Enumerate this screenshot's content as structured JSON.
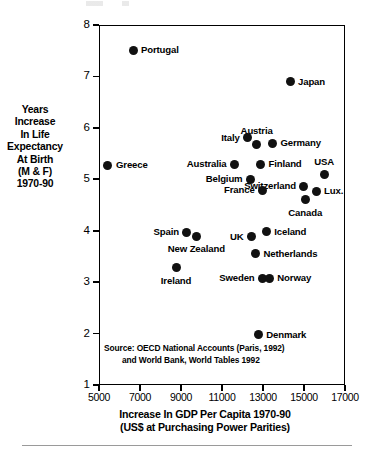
{
  "chart_data": {
    "type": "scatter",
    "title": "",
    "xlabel": "Increase In GDP Per Capita 1970-90",
    "xlabel_line2": "(US$ at Purchasing Power Parities)",
    "ylabel_lines": [
      "Years",
      "Increase",
      "In Life",
      "Expectancy",
      "At Birth",
      "(M & F)",
      "1970-90"
    ],
    "xlim": [
      5000,
      17000
    ],
    "ylim": [
      1,
      8
    ],
    "xticks": [
      5000,
      7000,
      9000,
      11000,
      13000,
      15000,
      17000
    ],
    "xtick_labels": [
      "5000",
      "7000",
      "9000",
      "11000",
      "13000",
      "15000",
      "17000"
    ],
    "yticks": [
      1,
      2,
      3,
      4,
      5,
      6,
      7,
      8
    ],
    "ytick_labels": [
      "1",
      "2",
      "3",
      "4",
      "5",
      "6",
      "7",
      "8"
    ],
    "grid": false,
    "legend": "none",
    "marker_color": "#111111",
    "points": [
      {
        "label": "Portugal",
        "x": 6610,
        "y": 7.53,
        "label_pos": "right"
      },
      {
        "label": "Japan",
        "x": 14270,
        "y": 6.92,
        "label_pos": "right"
      },
      {
        "label": "Greece",
        "x": 5390,
        "y": 5.29,
        "label_pos": "right"
      },
      {
        "label": "Italy",
        "x": 12200,
        "y": 5.83,
        "label_pos": "left"
      },
      {
        "label": "Austria",
        "x": 12640,
        "y": 5.7,
        "label_pos": "above"
      },
      {
        "label": "Germany",
        "x": 13410,
        "y": 5.72,
        "label_pos": "right"
      },
      {
        "label": "Australia",
        "x": 11560,
        "y": 5.31,
        "label_pos": "left"
      },
      {
        "label": "Finland",
        "x": 12830,
        "y": 5.31,
        "label_pos": "right"
      },
      {
        "label": "USA",
        "x": 15930,
        "y": 5.11,
        "label_pos": "above"
      },
      {
        "label": "Belgium",
        "x": 12340,
        "y": 5.02,
        "label_pos": "left"
      },
      {
        "label": "Switzerland",
        "x": 14950,
        "y": 4.88,
        "label_pos": "left"
      },
      {
        "label": "Lux.",
        "x": 15540,
        "y": 4.79,
        "label_pos": "right"
      },
      {
        "label": "France",
        "x": 12930,
        "y": 4.81,
        "label_pos": "left"
      },
      {
        "label": "Canada",
        "x": 15010,
        "y": 4.62,
        "label_pos": "below"
      },
      {
        "label": "Spain",
        "x": 9240,
        "y": 3.99,
        "label_pos": "left"
      },
      {
        "label": "New Zealand",
        "x": 9700,
        "y": 3.91,
        "label_pos": "below"
      },
      {
        "label": "UK",
        "x": 12390,
        "y": 3.9,
        "label_pos": "left"
      },
      {
        "label": "Iceland",
        "x": 13110,
        "y": 4.0,
        "label_pos": "right"
      },
      {
        "label": "Netherlands",
        "x": 12590,
        "y": 3.57,
        "label_pos": "right"
      },
      {
        "label": "Ireland",
        "x": 8710,
        "y": 3.3,
        "label_pos": "below"
      },
      {
        "label": "Sweden",
        "x": 12930,
        "y": 3.1,
        "label_pos": "left"
      },
      {
        "label": "Norway",
        "x": 13260,
        "y": 3.1,
        "label_pos": "right"
      },
      {
        "label": "Denmark",
        "x": 12720,
        "y": 2.0,
        "label_pos": "right"
      }
    ],
    "source_note_line1": "Source: OECD National Accounts (Paris, 1992)",
    "source_note_line2": "and World Bank, World Tables 1992"
  }
}
